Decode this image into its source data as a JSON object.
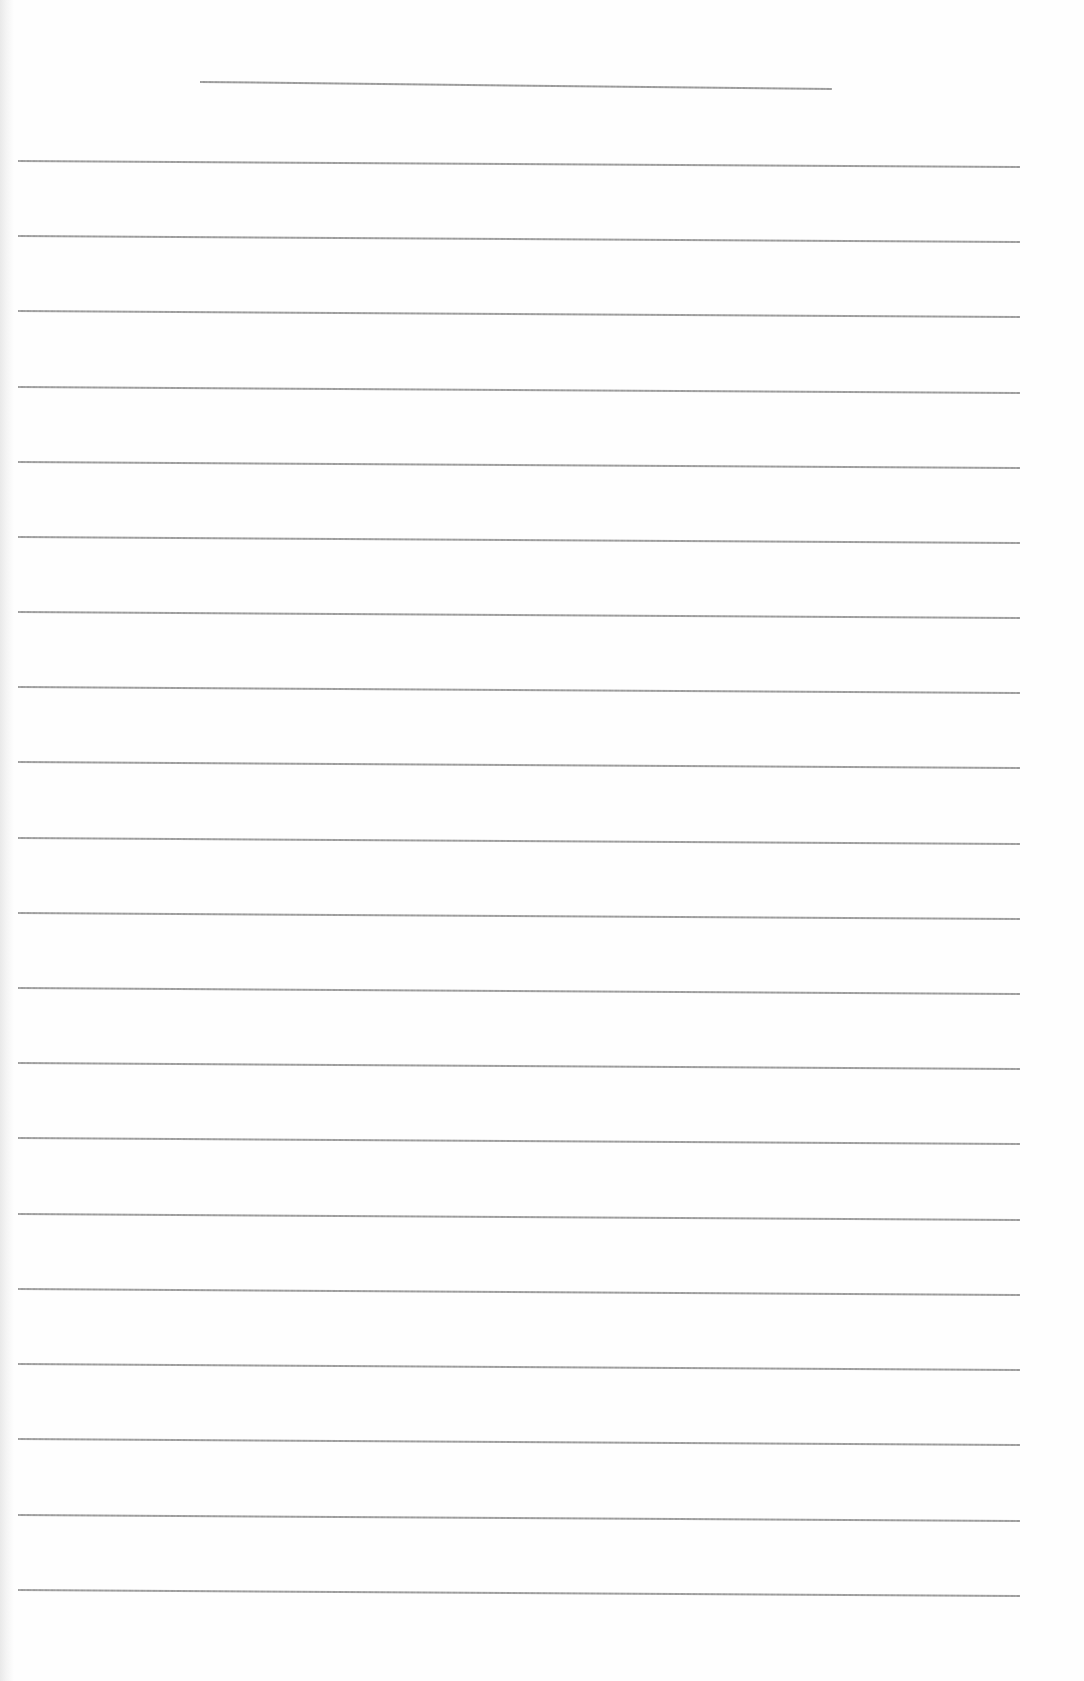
{
  "document": {
    "type": "blank ruled sheet",
    "text_content": "",
    "background_color": "#fefefe",
    "line_color": "#959595"
  },
  "title_line": {
    "x1": 200,
    "y1": 81,
    "x2": 832,
    "y2": 88
  },
  "ruled_lines": {
    "count": 20,
    "x_start": 18,
    "x_end": 1020,
    "tilt_px": 6,
    "y_positions": [
      160,
      235,
      310,
      386,
      461,
      536,
      611,
      686,
      761,
      837,
      912,
      987,
      1062,
      1137,
      1213,
      1288,
      1363,
      1438,
      1514,
      1589
    ]
  }
}
